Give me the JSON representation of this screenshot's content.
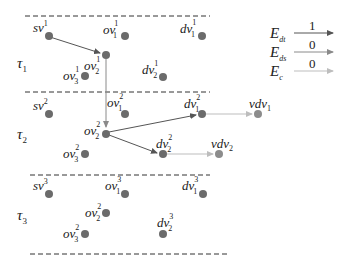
{
  "layers": [
    {
      "id": "tau1",
      "label": "τ",
      "sub": "1"
    },
    {
      "id": "tau2",
      "label": "τ",
      "sub": "2"
    },
    {
      "id": "tau3",
      "label": "τ",
      "sub": "3"
    }
  ],
  "nodes": {
    "sv1": {
      "base": "sv",
      "sub": "",
      "sup": "1"
    },
    "ov11": {
      "base": "ov",
      "sub": "1",
      "sup": "1"
    },
    "ov21": {
      "base": "ov",
      "sub": "2",
      "sup": "1"
    },
    "ov31": {
      "base": "ov",
      "sub": "3",
      "sup": "1"
    },
    "dv11": {
      "base": "dv",
      "sub": "1",
      "sup": "1"
    },
    "dv21": {
      "base": "dv",
      "sub": "2",
      "sup": "1"
    },
    "sv2": {
      "base": "sv",
      "sub": "",
      "sup": "2"
    },
    "ov12": {
      "base": "ov",
      "sub": "1",
      "sup": "2"
    },
    "ov22": {
      "base": "ov",
      "sub": "2",
      "sup": "2"
    },
    "ov32": {
      "base": "ov",
      "sub": "3",
      "sup": "2"
    },
    "dv12": {
      "base": "dv",
      "sub": "1",
      "sup": "2"
    },
    "dv22": {
      "base": "dv",
      "sub": "2",
      "sup": "2"
    },
    "vdv1": {
      "base": "vdv",
      "sub": "1",
      "sup": ""
    },
    "vdv2": {
      "base": "vdv",
      "sub": "2",
      "sup": ""
    },
    "sv3": {
      "base": "sv",
      "sub": "",
      "sup": "3"
    },
    "ov13": {
      "base": "ov",
      "sub": "1",
      "sup": "3"
    },
    "ov23": {
      "base": "ov",
      "sub": "2",
      "sup": "2"
    },
    "ov33": {
      "base": "ov",
      "sub": "3",
      "sup": "2"
    },
    "dv13": {
      "base": "dv",
      "sub": "1",
      "sup": "3"
    },
    "dv23": {
      "base": "dv",
      "sub": "2",
      "sup": "3"
    }
  },
  "edges": [
    {
      "from": "sv1",
      "to": "ov21",
      "type": "E_dt"
    },
    {
      "from": "ov21",
      "to": "ov22",
      "type": "E_ds"
    },
    {
      "from": "ov22",
      "to": "dv12",
      "type": "E_dt"
    },
    {
      "from": "ov22",
      "to": "dv22",
      "type": "E_dt"
    },
    {
      "from": "dv12",
      "to": "vdv1",
      "type": "E_c"
    },
    {
      "from": "dv22",
      "to": "vdv2",
      "type": "E_c"
    }
  ],
  "legend": [
    {
      "base": "E",
      "sub": "dt",
      "value": "1",
      "color": "#555555"
    },
    {
      "base": "E",
      "sub": "ds",
      "value": "0",
      "color": "#8a8a8a"
    },
    {
      "base": "E",
      "sub": "c",
      "value": "0",
      "color": "#bdbdbd"
    }
  ],
  "colors": {
    "node": "#6b6b6b",
    "vnode": "#8c8c8c",
    "dash": "#333333"
  }
}
